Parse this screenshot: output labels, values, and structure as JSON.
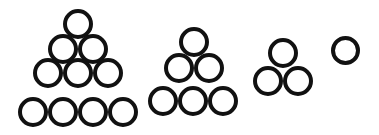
{
  "figure": {
    "background_color": "#ffffff",
    "stroke_color": "#111111",
    "width": 379,
    "height": 135
  },
  "chart_data": {
    "type": "diagram",
    "xlabel": "",
    "ylabel": "",
    "categories": [
      "group-1",
      "group-2",
      "group-3",
      "group-4"
    ],
    "values": [
      10,
      6,
      3,
      1
    ],
    "series": [
      {
        "name": "rows",
        "values": [
          4,
          3,
          2,
          1
        ]
      },
      {
        "name": "circle_count",
        "values": [
          10,
          6,
          3,
          1
        ]
      }
    ],
    "annotations": [
      "Each group is a close-packed triangular stack of open circles",
      "Counts form the triangular numbers 10, 6, 3, 1 decreasing left to right"
    ]
  },
  "groups": [
    {
      "name": "pyramid-10",
      "rows": 4,
      "count": 10,
      "diameter": 30,
      "stroke": 4,
      "color": "#111111",
      "circles": [
        {
          "cx": 77.5,
          "cy": 24.0
        },
        {
          "cx": 62.5,
          "cy": 48.7
        },
        {
          "cx": 92.5,
          "cy": 48.7
        },
        {
          "cx": 47.5,
          "cy": 73.4
        },
        {
          "cx": 77.5,
          "cy": 73.4
        },
        {
          "cx": 107.5,
          "cy": 73.4
        },
        {
          "cx": 33.0,
          "cy": 112.0
        },
        {
          "cx": 63.0,
          "cy": 112.0
        },
        {
          "cx": 93.0,
          "cy": 112.0
        },
        {
          "cx": 123.0,
          "cy": 112.0
        }
      ]
    },
    {
      "name": "pyramid-6",
      "rows": 3,
      "count": 6,
      "diameter": 30,
      "stroke": 4,
      "color": "#111111",
      "circles": [
        {
          "cx": 193.5,
          "cy": 42.0
        },
        {
          "cx": 178.5,
          "cy": 67.5
        },
        {
          "cx": 208.5,
          "cy": 67.5
        },
        {
          "cx": 163.0,
          "cy": 101.0
        },
        {
          "cx": 193.0,
          "cy": 101.0
        },
        {
          "cx": 223.0,
          "cy": 101.0
        }
      ]
    },
    {
      "name": "pyramid-3",
      "rows": 2,
      "count": 3,
      "diameter": 30,
      "stroke": 4,
      "color": "#111111",
      "circles": [
        {
          "cx": 283.0,
          "cy": 53.0
        },
        {
          "cx": 267.5,
          "cy": 81.0
        },
        {
          "cx": 297.5,
          "cy": 81.0
        }
      ]
    },
    {
      "name": "pyramid-1",
      "rows": 1,
      "count": 1,
      "diameter": 29,
      "stroke": 4,
      "color": "#111111",
      "circles": [
        {
          "cx": 345.5,
          "cy": 50.0
        }
      ]
    }
  ]
}
